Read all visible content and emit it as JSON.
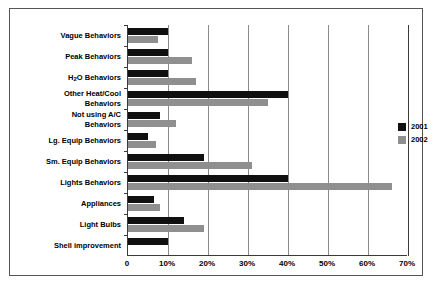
{
  "chart_data": {
    "type": "bar",
    "orientation": "horizontal",
    "title": "",
    "xlabel": "",
    "ylabel": "",
    "xlim": [
      0,
      70
    ],
    "xticks": [
      0,
      10,
      20,
      30,
      40,
      50,
      60,
      70
    ],
    "xtick_labels": [
      "0",
      "10%",
      "20%",
      "30%",
      "40%",
      "50%",
      "60%",
      "70%"
    ],
    "grid": true,
    "legend_position": "right",
    "categories": [
      "Vague Behaviors",
      "Peak Behaviors",
      "H2O Behaviors",
      "Other Heat/Cool Behaviors",
      "Not using A/C Behaviors",
      "Lg. Equip Behaviors",
      "Sm. Equip Behaviors",
      "Lights Behaviors",
      "Appliances",
      "Light Bulbs",
      "Shell improvement"
    ],
    "series": [
      {
        "name": "2001",
        "color": "#101010",
        "values": [
          10,
          10,
          10,
          40,
          8,
          5,
          19,
          40,
          6.5,
          14,
          10
        ]
      },
      {
        "name": "2002",
        "color": "#8f8f8f",
        "values": [
          7.5,
          16,
          17,
          35,
          12,
          7,
          31,
          66,
          8,
          19,
          0
        ]
      }
    ]
  },
  "labels": {
    "categories_display": [
      "Vague Behaviors",
      "Peak Behaviors",
      "H<sub>2</sub>O Behaviors",
      "Other Heat/Cool<br>Behaviors",
      "Not using A/C<br>Behaviors",
      "Lg. Equip Behaviors",
      "Sm. Equip Behaviors",
      "Lights Behaviors",
      "Appliances",
      "Light Bulbs",
      "Shell improvement"
    ]
  },
  "legend": {
    "items": [
      {
        "label": "2001",
        "color": "#101010"
      },
      {
        "label": "2002",
        "color": "#8f8f8f"
      }
    ]
  }
}
